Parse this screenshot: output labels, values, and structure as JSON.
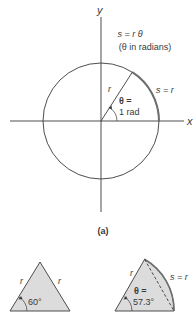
{
  "figure": {
    "panel_a": {
      "axis_x_label": "x",
      "axis_y_label": "y",
      "formula": "s = r θ",
      "formula_note": "(θ in radians)",
      "radius_label": "r",
      "arc_label": "s = r",
      "angle_label_line1": "θ =",
      "angle_label_line2": "1 rad",
      "caption": "(a)"
    },
    "triangle": {
      "side_left_label": "r",
      "side_right_label": "r",
      "angle_label": "60°"
    },
    "sector": {
      "side_label": "r",
      "arc_label": "s = r",
      "angle_label_line1": "θ =",
      "angle_label_line2": "57.3°"
    },
    "colors": {
      "line": "#3a3a3a",
      "arc_highlight": "#6e6e6e",
      "fill": "#dcdcdc"
    }
  }
}
